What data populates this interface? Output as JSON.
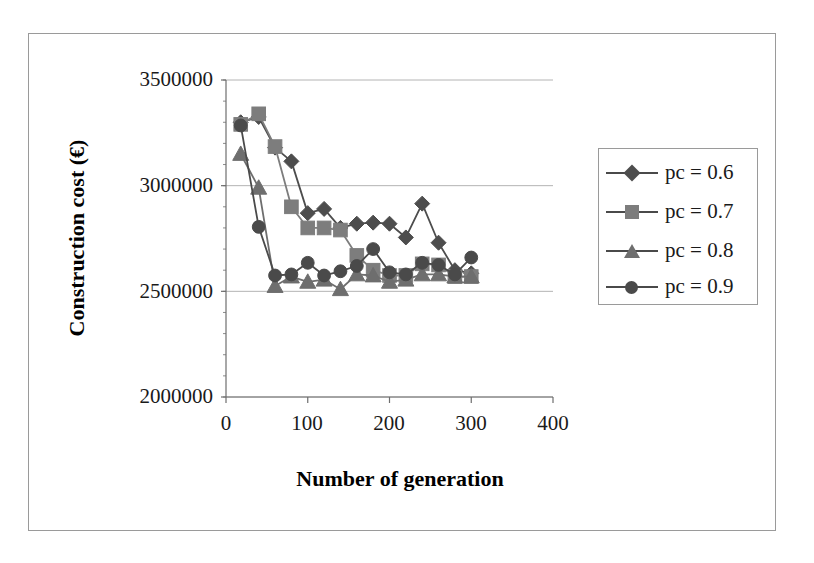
{
  "chart_data": {
    "type": "line",
    "title": "",
    "xlabel": "Number of generation",
    "ylabel": "Construction cost (€)",
    "xlim": [
      0,
      400
    ],
    "ylim": [
      2000000,
      3500000
    ],
    "xticks": [
      "0",
      "100",
      "200",
      "300",
      "400"
    ],
    "xtick_values": [
      0,
      100,
      200,
      300,
      400
    ],
    "yticks": [
      "2000000",
      "2500000",
      "3000000",
      "3500000"
    ],
    "ytick_values": [
      2000000,
      2500000,
      3000000,
      3500000
    ],
    "grid": "horizontal",
    "legend_position": "right",
    "series": [
      {
        "name": "pc = 0.6",
        "marker": "diamond",
        "color": "#4d4d4d",
        "x": [
          18,
          40,
          60,
          80,
          100,
          120,
          140,
          160,
          180,
          200,
          220,
          240,
          260,
          280,
          300
        ],
        "y": [
          3300000,
          3325000,
          3180000,
          3115000,
          2870000,
          2890000,
          2800000,
          2820000,
          2825000,
          2820000,
          2755000,
          2915000,
          2730000,
          2600000,
          2585000
        ]
      },
      {
        "name": "pc = 0.7",
        "marker": "square",
        "color": "#7d7d7d",
        "x": [
          18,
          40,
          60,
          80,
          100,
          120,
          140,
          160,
          180,
          200,
          220,
          240,
          260,
          280,
          300
        ],
        "y": [
          3290000,
          3340000,
          3185000,
          2900000,
          2800000,
          2800000,
          2790000,
          2670000,
          2600000,
          2575000,
          2575000,
          2630000,
          2625000,
          2570000,
          2570000
        ]
      },
      {
        "name": "pc = 0.8",
        "marker": "triangle",
        "color": "#6e6e6e",
        "x": [
          18,
          40,
          60,
          80,
          100,
          120,
          140,
          160,
          180,
          200,
          220,
          240,
          260,
          280,
          300
        ],
        "y": [
          3150000,
          2990000,
          2525000,
          2570000,
          2545000,
          2555000,
          2510000,
          2580000,
          2575000,
          2545000,
          2555000,
          2580000,
          2580000,
          2570000,
          2570000
        ]
      },
      {
        "name": "pc = 0.9",
        "marker": "circle",
        "color": "#4a4a4a",
        "x": [
          18,
          40,
          60,
          80,
          100,
          120,
          140,
          160,
          180,
          200,
          220,
          240,
          260,
          280,
          300
        ],
        "y": [
          3285000,
          2805000,
          2575000,
          2580000,
          2635000,
          2575000,
          2595000,
          2620000,
          2700000,
          2590000,
          2580000,
          2635000,
          2625000,
          2580000,
          2660000
        ]
      }
    ]
  },
  "axis": {
    "ylabel": "Construction cost (€)",
    "xlabel": "Number of generation",
    "ytick_0": "2000000",
    "ytick_1": "2500000",
    "ytick_2": "3000000",
    "ytick_3": "3500000",
    "xtick_0": "0",
    "xtick_1": "100",
    "xtick_2": "200",
    "xtick_3": "300",
    "xtick_4": "400"
  },
  "legend": {
    "items": [
      {
        "label": "pc = 0.6",
        "marker": "diamond-marker-icon"
      },
      {
        "label": "pc = 0.7",
        "marker": "square-marker-icon"
      },
      {
        "label": "pc = 0.8",
        "marker": "triangle-marker-icon"
      },
      {
        "label": "pc = 0.9",
        "marker": "circle-marker-icon"
      }
    ]
  },
  "colors": {
    "series_1": "#4d4d4d",
    "series_2": "#7d7d7d",
    "series_3": "#6e6e6e",
    "series_4": "#4a4a4a",
    "grid": "#b4b4b4",
    "axis": "#6e6e6e",
    "frame": "#9a9a9a",
    "background": "#ffffff"
  }
}
